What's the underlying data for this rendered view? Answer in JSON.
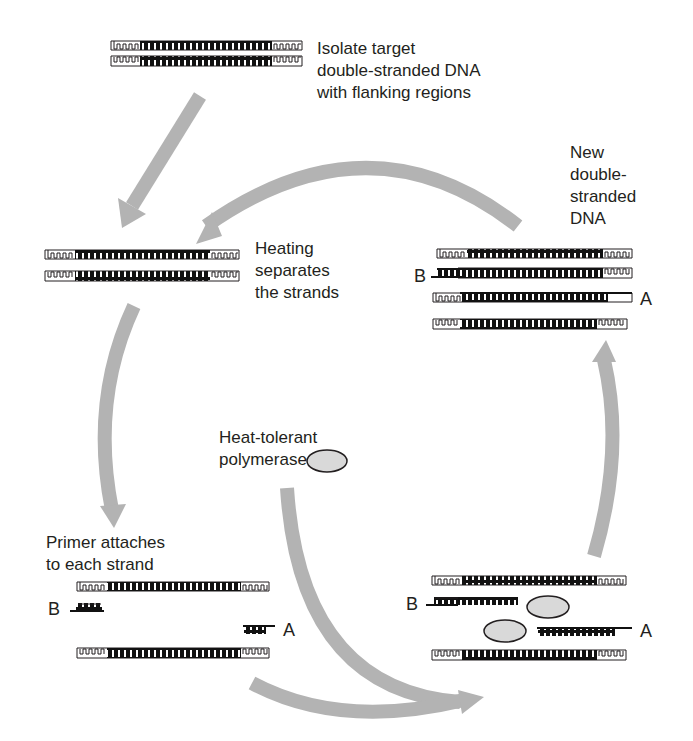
{
  "colors": {
    "arrow": "#b3b3b3",
    "dna_dark": "#111111",
    "dna_outline": "#231f20",
    "polymerase_fill": "#d9d9d9",
    "background": "#ffffff"
  },
  "steps": {
    "isolate": {
      "lines": [
        "Isolate target",
        "double-stranded DNA",
        "with flanking regions"
      ]
    },
    "heating": {
      "lines": [
        "Heating",
        "separates",
        "the strands"
      ]
    },
    "primer": {
      "lines": [
        "Primer attaches",
        "to each strand"
      ]
    },
    "polymerase": {
      "lines": [
        "Heat-tolerant",
        "polymerase"
      ]
    },
    "new_dna": {
      "lines": [
        "New",
        "double-",
        "stranded",
        "DNA"
      ]
    }
  },
  "primer_labels": {
    "a": "A",
    "b": "B"
  }
}
